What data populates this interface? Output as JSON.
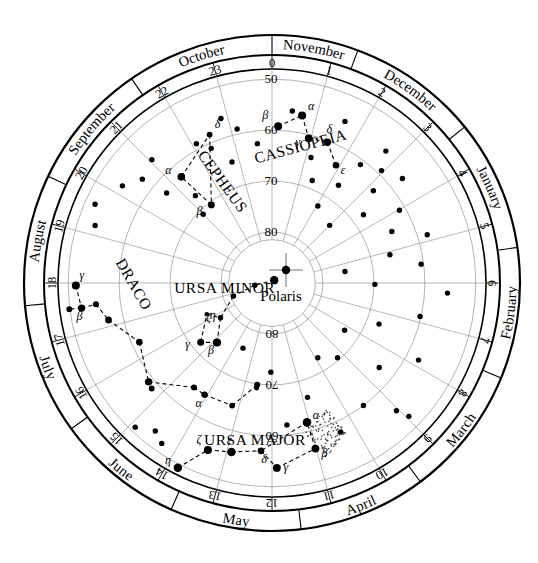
{
  "center": {
    "label": "Polaris",
    "marker": "cross"
  },
  "canvas": {
    "width": 538,
    "height": 563,
    "cx": 272,
    "cy": 283
  },
  "rings": {
    "outer_radius": 248,
    "month_band_outer": 248,
    "month_band_inner": 228,
    "hour_band_outer": 228,
    "hour_band_inner": 214,
    "sky_radius": 214,
    "inner_blank_radius": 46
  },
  "months": [
    {
      "name": "November",
      "start_hour": 0.0,
      "end_hour": 1.35
    },
    {
      "name": "December",
      "start_hour": 1.35,
      "end_hour": 3.4
    },
    {
      "name": "January",
      "start_hour": 3.4,
      "end_hour": 5.45
    },
    {
      "name": "February",
      "start_hour": 5.45,
      "end_hour": 7.5
    },
    {
      "name": "March",
      "start_hour": 7.5,
      "end_hour": 9.55
    },
    {
      "name": "April",
      "start_hour": 9.55,
      "end_hour": 11.55
    },
    {
      "name": "May",
      "start_hour": 11.55,
      "end_hour": 13.6
    },
    {
      "name": "June",
      "start_hour": 13.6,
      "end_hour": 15.6
    },
    {
      "name": "July",
      "start_hour": 15.6,
      "end_hour": 17.65
    },
    {
      "name": "August",
      "start_hour": 17.65,
      "end_hour": 19.7
    },
    {
      "name": "September",
      "start_hour": 19.7,
      "end_hour": 21.7
    },
    {
      "name": "October",
      "start_hour": 21.7,
      "end_hour": 24.0
    }
  ],
  "hour_labels": [
    "0",
    "1",
    "2",
    "3",
    "4",
    "5",
    "6",
    "7",
    "8",
    "9",
    "10",
    "11",
    "12",
    "13",
    "14",
    "15",
    "16",
    "17",
    "18",
    "19",
    "20",
    "21",
    "22",
    "23"
  ],
  "declination_labels": [
    {
      "value": "50",
      "dec": 50,
      "hour": 0
    },
    {
      "value": "60",
      "dec": 60,
      "hour": 0
    },
    {
      "value": "70",
      "dec": 70,
      "hour": 0
    },
    {
      "value": "80",
      "dec": 80,
      "hour": 0
    },
    {
      "value": "80",
      "dec": 80,
      "hour": 12
    },
    {
      "value": "70",
      "dec": 70,
      "hour": 12
    },
    {
      "value": "60",
      "dec": 60,
      "hour": 12
    }
  ],
  "declination_circles": [
    50,
    60,
    70,
    80
  ],
  "constellations": [
    {
      "name": "CASSIOPEIA",
      "label_hour": 0.85,
      "label_dec": 63.5,
      "label_rotation": -15,
      "stars": [
        {
          "greek": "β",
          "ra": 0.15,
          "dec": 59.2,
          "mag": 2.3,
          "lx": -13,
          "ly": -7
        },
        {
          "greek": "α",
          "ra": 0.68,
          "dec": 56.6,
          "mag": 2.2,
          "lx": 9,
          "ly": -6
        },
        {
          "greek": "γ",
          "ra": 0.95,
          "dec": 60.7,
          "mag": 2.4,
          "lx": -11,
          "ly": 8
        },
        {
          "greek": "δ",
          "ra": 1.43,
          "dec": 60.3,
          "mag": 2.7,
          "lx": 2,
          "ly": -9
        },
        {
          "greek": "ε",
          "ra": 1.9,
          "dec": 63.7,
          "mag": 3.4,
          "lx": 7,
          "ly": 9
        }
      ],
      "lines": [
        [
          0,
          1
        ],
        [
          1,
          2
        ],
        [
          2,
          3
        ],
        [
          3,
          4
        ]
      ]
    },
    {
      "name": "CEPHEUS",
      "label_hour": 22.1,
      "label_dec": 68.0,
      "label_rotation": 54,
      "stars": [
        {
          "greek": "α",
          "ra": 21.3,
          "dec": 62.6,
          "mag": 2.5,
          "lx": -13,
          "ly": -3
        },
        {
          "greek": "δ",
          "ra": 22.48,
          "dec": 58.4,
          "mag": 4.0,
          "lx": 8,
          "ly": -7
        },
        {
          "greek": "β",
          "ra": 21.48,
          "dec": 70.6,
          "mag": 3.2,
          "lx": -12,
          "ly": 10
        }
      ],
      "lines": [
        [
          0,
          1
        ],
        [
          1,
          2
        ],
        [
          2,
          0
        ]
      ]
    },
    {
      "name": "URSA MINOR",
      "label_hour": 17.2,
      "label_dec": 80.5,
      "label_rotation": 0,
      "stars": [
        {
          "greek": "",
          "ra": 2.53,
          "dec": 89.3,
          "mag": 2.0,
          "lx": 0,
          "ly": 0
        },
        {
          "greek": "",
          "ra": 17.5,
          "dec": 86.6,
          "mag": 4.3,
          "lx": 0,
          "ly": 0
        },
        {
          "greek": "",
          "ra": 16.75,
          "dec": 82.0,
          "mag": 4.2,
          "lx": 0,
          "ly": 0
        },
        {
          "greek": "ζ",
          "ra": 15.73,
          "dec": 77.8,
          "mag": 4.3,
          "lx": -12,
          "ly": 3
        },
        {
          "greek": "β",
          "ra": 14.85,
          "dec": 74.1,
          "mag": 2.1,
          "lx": -6,
          "ly": 12
        },
        {
          "greek": "γ",
          "ra": 15.35,
          "dec": 71.8,
          "mag": 3.0,
          "lx": -13,
          "ly": 6
        },
        {
          "greek": "η",
          "ra": 16.29,
          "dec": 75.8,
          "mag": 5.0,
          "lx": 6,
          "ly": 5
        }
      ],
      "lines": [
        [
          0,
          1
        ],
        [
          1,
          2
        ],
        [
          2,
          3
        ],
        [
          3,
          4
        ],
        [
          4,
          5
        ],
        [
          5,
          6
        ],
        [
          6,
          3
        ]
      ]
    },
    {
      "name": "URSA MAJOR",
      "label_hour": 12.4,
      "label_dec": 58.0,
      "label_rotation": 0,
      "stars": [
        {
          "greek": "η",
          "ra": 13.8,
          "dec": 49.3,
          "mag": 1.9,
          "lx": -10,
          "ly": -4
        },
        {
          "greek": "ζ",
          "ra": 13.4,
          "dec": 54.9,
          "mag": 2.2,
          "lx": -9,
          "ly": -7
        },
        {
          "greek": "ε",
          "ra": 12.9,
          "dec": 55.9,
          "mag": 1.8,
          "lx": -2,
          "ly": -8
        },
        {
          "greek": "δ",
          "ra": 12.25,
          "dec": 57.0,
          "mag": 3.3,
          "lx": 3,
          "ly": 12
        },
        {
          "greek": "γ",
          "ra": 11.9,
          "dec": 53.7,
          "mag": 2.4,
          "lx": 9,
          "ly": 3
        },
        {
          "greek": "β",
          "ra": 11.02,
          "dec": 56.4,
          "mag": 2.4,
          "lx": 9,
          "ly": 8
        },
        {
          "greek": "α",
          "ra": 11.06,
          "dec": 61.8,
          "mag": 1.8,
          "lx": 9,
          "ly": -3
        }
      ],
      "lines": [
        [
          0,
          1
        ],
        [
          1,
          2
        ],
        [
          2,
          3
        ],
        [
          3,
          4
        ],
        [
          4,
          5
        ],
        [
          5,
          6
        ],
        [
          6,
          3
        ]
      ]
    },
    {
      "name": "DRACO",
      "label_hour": 17.9,
      "label_dec": 62.0,
      "label_rotation": 60,
      "stars": [
        {
          "greek": "γ",
          "ra": 17.95,
          "dec": 51.5,
          "mag": 2.2,
          "lx": 6,
          "ly": -7
        },
        {
          "greek": "β",
          "ra": 17.5,
          "dec": 52.3,
          "mag": 2.8,
          "lx": -2,
          "ly": 12
        },
        {
          "greek": "",
          "ra": 17.54,
          "dec": 55.2,
          "mag": 3.8,
          "lx": 0,
          "ly": 0
        },
        {
          "greek": "",
          "ra": 17.15,
          "dec": 57.1,
          "mag": 3.2,
          "lx": 0,
          "ly": 0
        },
        {
          "greek": "",
          "ra": 17.51,
          "dec": 49.9,
          "mag": 3.9,
          "lx": 0,
          "ly": 0
        },
        {
          "greek": "",
          "ra": 16.4,
          "dec": 61.5,
          "mag": 3.3,
          "lx": 0,
          "ly": 0
        },
        {
          "greek": "",
          "ra": 15.42,
          "dec": 58.97,
          "mag": 2.7,
          "lx": 0,
          "ly": 0
        },
        {
          "greek": "",
          "ra": 14.45,
          "dec": 64.4,
          "mag": 3.8,
          "lx": 0,
          "ly": 0
        },
        {
          "greek": "",
          "ra": 15.25,
          "dec": 58.6,
          "mag": 4.0,
          "lx": 0,
          "ly": 0
        },
        {
          "greek": "",
          "ra": 14.08,
          "dec": 64.4,
          "mag": 3.9,
          "lx": 0,
          "ly": 0
        },
        {
          "greek": "",
          "ra": 13.2,
          "dec": 64.7,
          "mag": 4.0,
          "lx": 0,
          "ly": 0
        },
        {
          "greek": "",
          "ra": 12.55,
          "dec": 69.8,
          "mag": 3.8,
          "lx": 0,
          "ly": 0
        },
        {
          "greek": "",
          "ra": 12.56,
          "dec": 69.2,
          "mag": 4.6,
          "lx": 0,
          "ly": 0
        },
        {
          "greek": "α",
          "ra": 14.07,
          "dec": 64.4,
          "mag": 3.7,
          "lx": -6,
          "ly": 12
        }
      ],
      "lines": [
        [
          0,
          1
        ],
        [
          1,
          2
        ],
        [
          2,
          3
        ],
        [
          3,
          5
        ],
        [
          5,
          6
        ],
        [
          6,
          7
        ],
        [
          7,
          9
        ],
        [
          9,
          10
        ],
        [
          10,
          11
        ],
        [
          1,
          4
        ]
      ]
    }
  ],
  "field_stars": [
    {
      "ra": 0.45,
      "dec": 56.0
    },
    {
      "ra": 1.62,
      "dec": 55.2
    },
    {
      "ra": 1.15,
      "dec": 64.2
    },
    {
      "ra": 1.43,
      "dec": 68.4
    },
    {
      "ra": 2.05,
      "dec": 72.4
    },
    {
      "ra": 2.28,
      "dec": 66.8
    },
    {
      "ra": 2.72,
      "dec": 55.8
    },
    {
      "ra": 2.95,
      "dec": 59.2
    },
    {
      "ra": 3.18,
      "dec": 63.1
    },
    {
      "ra": 2.45,
      "dec": 61.0
    },
    {
      "ra": 3.55,
      "dec": 67.6
    },
    {
      "ra": 3.42,
      "dec": 57.2
    },
    {
      "ra": 4.02,
      "dec": 61.2
    },
    {
      "ra": 4.45,
      "dec": 64.4
    },
    {
      "ra": 4.85,
      "dec": 58.1
    },
    {
      "ra": 5.1,
      "dec": 66.2
    },
    {
      "ra": 5.52,
      "dec": 60.5
    },
    {
      "ra": 6.22,
      "dec": 55.5
    },
    {
      "ra": 6.05,
      "dec": 69.8
    },
    {
      "ra": 6.85,
      "dec": 60.2
    },
    {
      "ra": 7.4,
      "dec": 67.5
    },
    {
      "ra": 7.85,
      "dec": 57.5
    },
    {
      "ra": 8.55,
      "dec": 63.2
    },
    {
      "ra": 9.05,
      "dec": 55.0
    },
    {
      "ra": 9.55,
      "dec": 60.0
    },
    {
      "ra": 9.25,
      "dec": 70.5
    },
    {
      "ra": 10.35,
      "dec": 57.8
    },
    {
      "ra": 10.85,
      "dec": 66.5
    },
    {
      "ra": 8.2,
      "dec": 73.0
    },
    {
      "ra": 11.6,
      "dec": 62.0
    },
    {
      "ra": 14.3,
      "dec": 51.8
    },
    {
      "ra": 14.55,
      "dec": 53.0
    },
    {
      "ra": 14.9,
      "dec": 51.0
    },
    {
      "ra": 21.05,
      "dec": 56.2
    },
    {
      "ra": 20.58,
      "dec": 57.4
    },
    {
      "ra": 20.2,
      "dec": 55.0
    },
    {
      "ra": 20.7,
      "dec": 62.8
    },
    {
      "ra": 21.25,
      "dec": 67.2
    },
    {
      "ra": 21.0,
      "dec": 70.9
    },
    {
      "ra": 22.1,
      "dec": 58.9
    },
    {
      "ra": 22.38,
      "dec": 61.0
    },
    {
      "ra": 22.78,
      "dec": 65.0
    },
    {
      "ra": 23.15,
      "dec": 59.0
    },
    {
      "ra": 22.85,
      "dec": 56.2
    },
    {
      "ra": 19.6,
      "dec": 52.0
    },
    {
      "ra": 19.2,
      "dec": 53.5
    },
    {
      "ra": 23.6,
      "dec": 62.5
    },
    {
      "ra": 12.05,
      "dec": 72.5
    },
    {
      "ra": 13.6,
      "dec": 76.0
    },
    {
      "ra": 9.9,
      "dec": 72.8
    },
    {
      "ra": 5.4,
      "dec": 75.5
    },
    {
      "ra": 3.0,
      "dec": 74.0
    },
    {
      "ra": 8.95,
      "dec": 52.5
    }
  ],
  "nebula_patch": {
    "ra": 10.7,
    "dec": 59.0,
    "type": "stippled-region"
  },
  "chart_data": {
    "type": "polar-scatter",
    "projection": "polar (declination radial, right ascension azimuthal)",
    "radial_axis": {
      "label": "Declination (degrees)",
      "ticks": [
        50,
        60,
        70,
        80,
        90
      ],
      "min": 50,
      "max": 90
    },
    "angular_axis": {
      "label": "Right Ascension (hours)",
      "ticks_min": 0,
      "ticks_max": 23,
      "direction": "clockwise-from-top"
    },
    "outer_axis": {
      "label": "Month",
      "ticks": [
        "November",
        "December",
        "January",
        "February",
        "March",
        "April",
        "May",
        "June",
        "July",
        "August",
        "September",
        "October"
      ]
    },
    "legend_position": "none",
    "grid": true,
    "annotations": [
      "Polaris",
      "CASSIOPEIA",
      "CEPHEUS",
      "URSA MINOR",
      "URSA MAJOR",
      "DRACO"
    ]
  }
}
